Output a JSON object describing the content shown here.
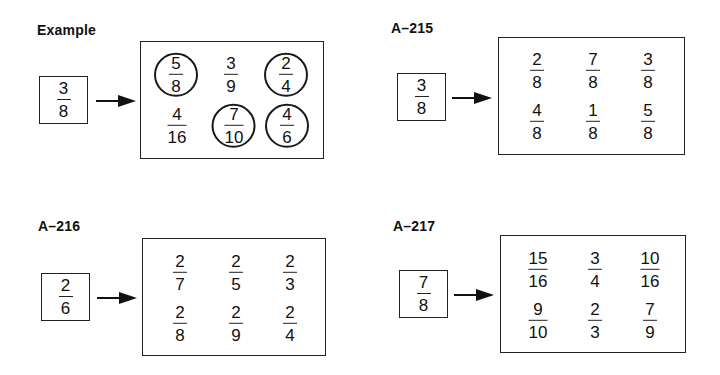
{
  "panels": [
    {
      "label": "Example",
      "target": {
        "n": "3",
        "d": "8"
      },
      "options": [
        {
          "n": "5",
          "d": "8",
          "circled": true
        },
        {
          "n": "3",
          "d": "9",
          "circled": false
        },
        {
          "n": "2",
          "d": "4",
          "circled": true
        },
        {
          "n": "4",
          "d": "16",
          "circled": false
        },
        {
          "n": "7",
          "d": "10",
          "circled": true
        },
        {
          "n": "4",
          "d": "6",
          "circled": true
        }
      ]
    },
    {
      "label": "A–215",
      "target": {
        "n": "3",
        "d": "8"
      },
      "options": [
        {
          "n": "2",
          "d": "8"
        },
        {
          "n": "7",
          "d": "8"
        },
        {
          "n": "3",
          "d": "8"
        },
        {
          "n": "4",
          "d": "8"
        },
        {
          "n": "1",
          "d": "8"
        },
        {
          "n": "5",
          "d": "8"
        }
      ]
    },
    {
      "label": "A–216",
      "target": {
        "n": "2",
        "d": "6"
      },
      "options": [
        {
          "n": "2",
          "d": "7"
        },
        {
          "n": "2",
          "d": "5"
        },
        {
          "n": "2",
          "d": "3"
        },
        {
          "n": "2",
          "d": "8"
        },
        {
          "n": "2",
          "d": "9"
        },
        {
          "n": "2",
          "d": "4"
        }
      ]
    },
    {
      "label": "A–217",
      "target": {
        "n": "7",
        "d": "8"
      },
      "options": [
        {
          "n": "15",
          "d": "16"
        },
        {
          "n": "3",
          "d": "4"
        },
        {
          "n": "10",
          "d": "16"
        },
        {
          "n": "9",
          "d": "10"
        },
        {
          "n": "2",
          "d": "3"
        },
        {
          "n": "7",
          "d": "9"
        }
      ]
    }
  ]
}
